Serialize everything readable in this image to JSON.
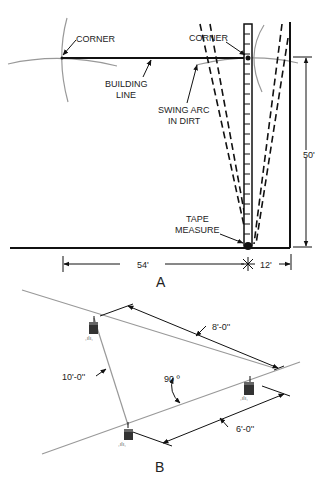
{
  "figure_a": {
    "label": "A",
    "callouts": {
      "corner_left": "CORNER",
      "corner_right": "CORNER",
      "building_line_1": "BUILDING",
      "building_line_2": "LINE",
      "swing_arc_1": "SWING ARC",
      "swing_arc_2": "IN DIRT",
      "tape_1": "TAPE",
      "tape_2": "MEASURE"
    },
    "dimensions": {
      "height": "50'",
      "left_width": "54'",
      "right_width": "12'"
    }
  },
  "figure_b": {
    "label": "B",
    "dimensions": {
      "top": "8'-0''",
      "diagonal": "10'-0''",
      "angle": "90 º",
      "bottom": "6'-0''"
    }
  }
}
